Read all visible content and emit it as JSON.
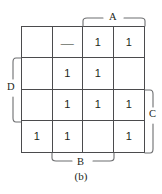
{
  "figure": {
    "caption": "(b)",
    "type": "karnaugh-map",
    "grid_rows": 4,
    "grid_cols": 4,
    "colors": {
      "background": "#ffffff",
      "grid_line": "#4b4b4d",
      "bracket": "#6d6e70",
      "text": "#231f20"
    }
  },
  "variables": {
    "A": {
      "label": "A",
      "position": "top",
      "spans_columns": [
        3,
        4
      ]
    },
    "B": {
      "label": "B",
      "position": "bottom",
      "spans_columns": [
        2,
        3
      ]
    },
    "C": {
      "label": "C",
      "position": "right",
      "spans_rows": [
        3,
        4
      ]
    },
    "D": {
      "label": "D",
      "position": "left",
      "spans_rows": [
        2,
        3
      ]
    }
  },
  "cells": [
    {
      "row": 1,
      "col": 1,
      "value": ""
    },
    {
      "row": 1,
      "col": 2,
      "value": "—"
    },
    {
      "row": 1,
      "col": 3,
      "value": "1"
    },
    {
      "row": 1,
      "col": 4,
      "value": "1"
    },
    {
      "row": 2,
      "col": 1,
      "value": ""
    },
    {
      "row": 2,
      "col": 2,
      "value": "1"
    },
    {
      "row": 2,
      "col": 3,
      "value": "1"
    },
    {
      "row": 2,
      "col": 4,
      "value": ""
    },
    {
      "row": 3,
      "col": 1,
      "value": ""
    },
    {
      "row": 3,
      "col": 2,
      "value": "1"
    },
    {
      "row": 3,
      "col": 3,
      "value": "1"
    },
    {
      "row": 3,
      "col": 4,
      "value": "1"
    },
    {
      "row": 4,
      "col": 1,
      "value": "1"
    },
    {
      "row": 4,
      "col": 2,
      "value": "1"
    },
    {
      "row": 4,
      "col": 3,
      "value": ""
    },
    {
      "row": 4,
      "col": 4,
      "value": "1"
    }
  ]
}
